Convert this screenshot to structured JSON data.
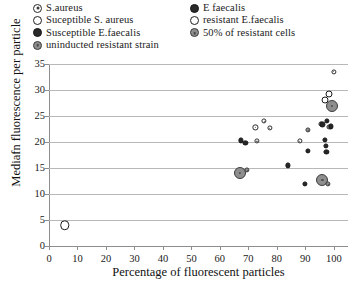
{
  "legend": {
    "left_column": [
      {
        "label": "S.aureus",
        "marker": "ring-dot"
      },
      {
        "label": "Suceptible S. aureus",
        "marker": "hollow"
      },
      {
        "label": "Susceptible E.faecalis",
        "marker": "dark"
      },
      {
        "label": "uninducted resistant strain",
        "marker": "gray"
      }
    ],
    "right_column": [
      {
        "label": "E faecalis",
        "marker": "dark"
      },
      {
        "label": "resistant E.faecalis",
        "marker": "hollow"
      },
      {
        "label": " 50% of resistant cells",
        "marker": "gray"
      }
    ]
  },
  "chart_data": {
    "type": "scatter",
    "title": "",
    "xlabel": "Percentage of fluorescent particles",
    "ylabel": "Mediafn fluorescence per particle",
    "xlim": [
      0,
      105
    ],
    "ylim": [
      0,
      35
    ],
    "xticks": [
      0,
      10,
      20,
      30,
      40,
      50,
      60,
      70,
      80,
      90,
      100
    ],
    "yticks": [
      0,
      5,
      10,
      15,
      20,
      25,
      30,
      35
    ],
    "grid": "horizontal",
    "legend_position": "above-plot",
    "series": [
      {
        "name": "Suceptible S. aureus",
        "marker": "hollow",
        "size": "large",
        "points": [
          [
            5.5,
            4.0
          ]
        ]
      },
      {
        "name": "resistant E.faecalis",
        "marker": "hollow",
        "size": "medium",
        "points": [
          [
            97.0,
            28.0
          ],
          [
            98.5,
            29.3
          ]
        ]
      },
      {
        "name": "50% of resistant cells",
        "marker": "gray",
        "size": "xlarge",
        "points": [
          [
            67.0,
            14.0
          ],
          [
            99.3,
            27.0
          ],
          [
            96.0,
            12.7
          ]
        ]
      },
      {
        "name": "uninducted resistant strain",
        "marker": "gray",
        "size": "small",
        "points": [
          [
            69.5,
            14.6
          ],
          [
            91.0,
            22.3
          ],
          [
            98.5,
            22.9
          ],
          [
            98.0,
            11.9
          ]
        ]
      },
      {
        "name": "S.aureus",
        "marker": "ring-dot",
        "size": "small",
        "points": [
          [
            100.0,
            33.5
          ],
          [
            75.5,
            24.0
          ],
          [
            72.5,
            22.8
          ],
          [
            77.5,
            22.7
          ],
          [
            88.0,
            20.2
          ],
          [
            73.0,
            20.2
          ],
          [
            95.5,
            23.5
          ]
        ]
      },
      {
        "name": "E faecalis",
        "marker": "dark",
        "size": "small",
        "points": [
          [
            96.0,
            23.4
          ],
          [
            97.5,
            24.1
          ],
          [
            67.5,
            20.3
          ],
          [
            69.0,
            19.9
          ],
          [
            97.0,
            20.4
          ],
          [
            97.3,
            19.2
          ],
          [
            97.4,
            18.1
          ],
          [
            91.0,
            18.3
          ],
          [
            84.0,
            15.5
          ],
          [
            90.0,
            12.0
          ],
          [
            99.0,
            23.0
          ]
        ]
      }
    ]
  }
}
